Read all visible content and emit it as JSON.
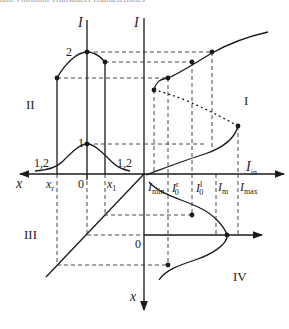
{
  "caption": "and Vibration Transducer characteristics",
  "quadrants": {
    "q1": "I",
    "q2": "II",
    "q3": "III",
    "q4": "IV"
  },
  "axes": {
    "left_vertical": "I",
    "right_vertical": "I",
    "horizontal_left": "x",
    "horizontal_right_main": "I",
    "horizontal_right_sub": "in",
    "vertical_down": "x",
    "origin_top": "0",
    "origin_bottom": "0"
  },
  "curve_labels": {
    "peak_1": "1",
    "peak_2": "2",
    "tail_left": "1,2",
    "tail_right": "1,2"
  },
  "x_ticks": {
    "x_r_main": "x",
    "x_r_sub": "r",
    "x_1_main": "x",
    "x_1_sub": "1"
  },
  "i_ticks": [
    {
      "main": "I",
      "sub": "min",
      "sup": ""
    },
    {
      "main": "I",
      "sub": "0",
      "sup": "r"
    },
    {
      "main": "I",
      "sub": "0",
      "sup": "l"
    },
    {
      "main": "I",
      "sub": "m",
      "sup": ""
    },
    {
      "main": "I",
      "sub": "max",
      "sup": ""
    }
  ],
  "colors": {
    "line": "#1a1a1a",
    "dash": "#333333"
  }
}
